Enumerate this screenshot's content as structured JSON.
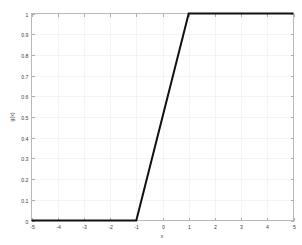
{
  "chart_data": {
    "type": "line",
    "title": "",
    "xlabel": "x",
    "ylabel": "g(x)",
    "xlim": [
      -5,
      5
    ],
    "ylim": [
      0,
      1
    ],
    "grid": true,
    "legend": "none",
    "line_color": "#111111",
    "background_color": "#ffffff",
    "axis_color": "#b9b9b9",
    "grid_color": "#ececec",
    "xticks": [
      "-5",
      "-4",
      "-3",
      "-2",
      "-1",
      "0",
      "1",
      "2",
      "3",
      "4",
      "5"
    ],
    "xtick_values": [
      -5,
      -4,
      -3,
      -2,
      -1,
      0,
      1,
      2,
      3,
      4,
      5
    ],
    "yticks": [
      "0",
      "0.1",
      "0.2",
      "0.3",
      "0.4",
      "0.5",
      "0.6",
      "0.7",
      "0.8",
      "0.9",
      "1"
    ],
    "ytick_values": [
      0,
      0.1,
      0.2,
      0.3,
      0.4,
      0.5,
      0.6,
      0.7,
      0.8,
      0.9,
      1
    ],
    "series": [
      {
        "name": "g(x)",
        "x": [
          -5,
          -4,
          -3,
          -2,
          -1,
          -0.5,
          0,
          0.5,
          1,
          2,
          3,
          4,
          5
        ],
        "values": [
          0,
          0,
          0,
          0,
          0,
          0.25,
          0.5,
          0.75,
          1,
          1,
          1,
          1,
          1
        ]
      }
    ],
    "annotations": []
  }
}
